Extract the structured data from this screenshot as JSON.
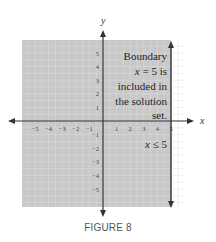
{
  "caption": "FIGURE 8",
  "chart_data": {
    "type": "area",
    "title": "",
    "xlabel": "x",
    "ylabel": "y",
    "xlim": [
      -6,
      6
    ],
    "ylim": [
      -6,
      6
    ],
    "grid": true,
    "x_ticks": [
      -5,
      -4,
      -3,
      -2,
      -1,
      1,
      2,
      3,
      4,
      5
    ],
    "y_ticks": [
      5,
      4,
      3,
      2,
      1,
      -1,
      -2,
      -3,
      -4,
      -5
    ],
    "inequality": "x ≤ 5",
    "boundary": {
      "type": "vertical_line",
      "x": 5,
      "style": "solid",
      "included": true
    },
    "shaded_region": {
      "x_from": -6,
      "x_to": 5,
      "y_from": -6,
      "y_to": 6
    },
    "annotations": [
      {
        "text": [
          "Boundary",
          "x = 5 is",
          "included in",
          "the solution",
          "set."
        ],
        "position": "upper-right-inside-shaded"
      },
      {
        "text": "x ≤ 5",
        "position": "lower-right-inside-shaded"
      }
    ],
    "colors": {
      "shade": "#c8c8c8",
      "grid": "#e0e0e0",
      "axis": "#333333",
      "boundary": "#333333"
    }
  }
}
